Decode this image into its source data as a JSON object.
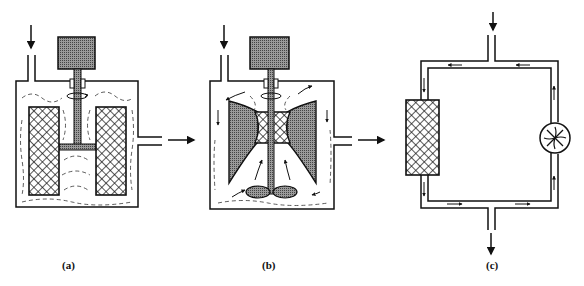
{
  "figure": {
    "panels": [
      {
        "id": "a",
        "label": "(a)",
        "description": "Stirred tank with stationary packed baskets and turbine on shaft"
      },
      {
        "id": "b",
        "label": "(b)",
        "description": "Stirred tank with spinning basket and bottom impeller, internal recirculation"
      },
      {
        "id": "c",
        "label": "(c)",
        "description": "External recycle loop with packed bed and circulating fan"
      }
    ],
    "colors": {
      "stroke": "#111111",
      "fill_dark": "#7a7a7a",
      "background": "#ffffff"
    }
  }
}
